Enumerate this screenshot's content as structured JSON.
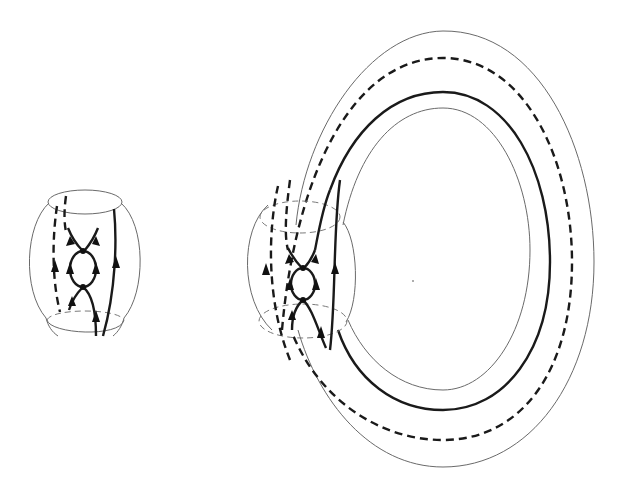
{
  "figure": {
    "colors": {
      "background": "#ffffff",
      "thin_line": "#6a6a6a",
      "thick_line": "#1a1a1a"
    },
    "panels": [
      {
        "id": "cylinder-piece",
        "shape": "bulged cylinder with top and bottom boundary circles",
        "curves": [
          {
            "style": "dashed",
            "direction": "up",
            "arrows": 1
          },
          {
            "style": "solid",
            "direction": "up",
            "arrows": 1
          },
          {
            "style": "loop with two vertices",
            "arrows": 4
          },
          {
            "style": "through-strand",
            "direction": "up",
            "arrows": 2
          }
        ]
      },
      {
        "id": "torus",
        "shape": "torus with local bulged neighbourhood on left side",
        "rings": [
          "outer thin",
          "dashed",
          "thick solid",
          "inner thin"
        ],
        "curves": [
          {
            "style": "dashed",
            "direction": "up",
            "arrows": 1
          },
          {
            "style": "solid",
            "direction": "up",
            "arrows": 1
          },
          {
            "style": "loop with two vertices",
            "arrows": 4
          },
          {
            "style": "through-strand",
            "direction": "up",
            "arrows": 2
          }
        ]
      }
    ]
  }
}
